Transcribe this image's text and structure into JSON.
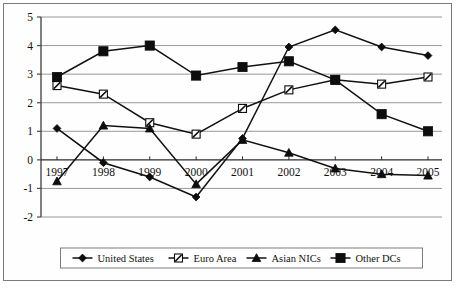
{
  "chart_data": {
    "type": "line",
    "title": "",
    "subtitle": "",
    "xlabel": "",
    "ylabel": "",
    "x": [
      1997,
      1998,
      1999,
      2000,
      2001,
      2002,
      2003,
      2004,
      2005
    ],
    "categories": [
      "1997",
      "1998",
      "1999",
      "2000",
      "2001",
      "2002",
      "2003",
      "2004",
      "2005"
    ],
    "ylim": [
      -2,
      5
    ],
    "yticks": [
      5,
      4,
      3,
      2,
      1,
      0,
      -1,
      -2
    ],
    "ytick_labels": [
      "5",
      "4",
      "3",
      "2",
      "1",
      "0",
      "-1",
      "-2"
    ],
    "grid": true,
    "grid_axis": "y",
    "zero_line": true,
    "legend_position": "bottom",
    "series": [
      {
        "name": "United States",
        "marker": "filled-diamond",
        "color": "#0d0d0d",
        "values": [
          1.1,
          -0.1,
          -0.6,
          -1.3,
          0.75,
          3.95,
          4.55,
          3.95,
          3.65
        ]
      },
      {
        "name": "Euro Area",
        "marker": "hatched-square",
        "color": "#0d0d0d",
        "values": [
          2.6,
          2.3,
          1.3,
          0.9,
          1.8,
          2.45,
          2.8,
          2.65,
          2.9
        ]
      },
      {
        "name": "Asian NICs",
        "marker": "filled-triangle",
        "color": "#0d0d0d",
        "values": [
          -0.75,
          1.2,
          1.1,
          -0.85,
          0.7,
          0.25,
          -0.3,
          -0.5,
          -0.55
        ]
      },
      {
        "name": "Other DCs",
        "marker": "filled-square",
        "color": "#0d0d0d",
        "values": [
          2.9,
          3.8,
          4.0,
          2.95,
          3.25,
          3.45,
          2.8,
          1.6,
          1.0
        ]
      }
    ]
  },
  "legend": {
    "items": [
      {
        "label": "United States",
        "marker": "filled-diamond"
      },
      {
        "label": "Euro Area",
        "marker": "hatched-square"
      },
      {
        "label": "Asian NICs",
        "marker": "filled-triangle"
      },
      {
        "label": "Other DCs",
        "marker": "filled-square"
      }
    ]
  }
}
